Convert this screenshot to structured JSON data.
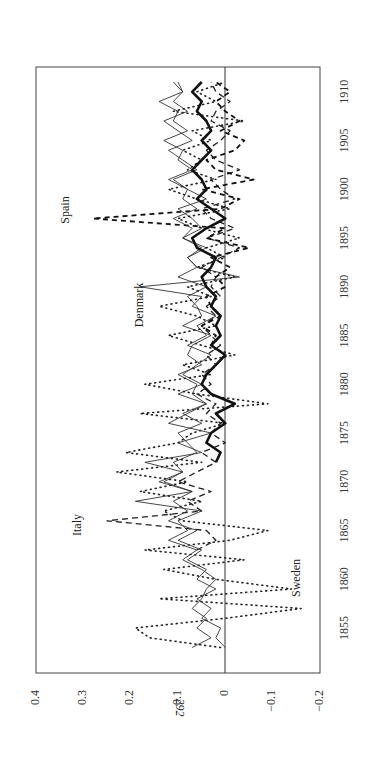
{
  "page": {
    "number": "292"
  },
  "chart_data": {
    "type": "line",
    "orientation": "rotated-90-counterclockwise",
    "title": "",
    "xlabel": "",
    "ylabel": "",
    "x_ticks": [
      1855,
      1860,
      1865,
      1870,
      1875,
      1880,
      1885,
      1890,
      1895,
      1900,
      1905,
      1910
    ],
    "y_ticks": [
      0.4,
      0.3,
      0.2,
      0.1,
      0,
      -0.1,
      -0.2
    ],
    "y_tick_labels": [
      "0.4",
      "0.3",
      "0.2",
      "0.1",
      "0",
      "−0.1",
      "−0.2"
    ],
    "xlim": [
      1852,
      1912
    ],
    "ylim": [
      -0.2,
      0.4
    ],
    "grid": false,
    "zero_line": true,
    "x": [
      1853,
      1854,
      1855,
      1856,
      1857,
      1858,
      1859,
      1860,
      1861,
      1862,
      1863,
      1864,
      1865,
      1866,
      1867,
      1868,
      1869,
      1870,
      1871,
      1872,
      1873,
      1874,
      1875,
      1876,
      1877,
      1878,
      1879,
      1880,
      1881,
      1882,
      1883,
      1884,
      1885,
      1886,
      1887,
      1888,
      1889,
      1890,
      1891,
      1892,
      1893,
      1894,
      1895,
      1896,
      1897,
      1898,
      1899,
      1900,
      1901,
      1902,
      1903,
      1904,
      1905,
      1906,
      1907,
      1908,
      1909,
      1910,
      1911
    ],
    "series": [
      {
        "name": "Italy",
        "style": "dashed",
        "label": "Italy",
        "values": [
          null,
          null,
          null,
          null,
          null,
          null,
          null,
          null,
          null,
          null,
          0.06,
          0.02,
          0.04,
          0.25,
          0.05,
          0.08,
          0.03,
          0.1,
          0.06,
          0.02,
          0.05,
          0.0,
          0.03,
          0.01,
          0.04,
          0.02,
          0.06,
          0.03,
          0.05,
          0.02,
          0.04,
          0.01,
          0.03,
          0.05,
          0.02,
          0.04,
          0.01,
          0.03,
          0.02,
          0.05,
          0.01,
          -0.03,
          0.04,
          -0.02,
          0.03,
          0.05,
          -0.02,
          0.01,
          0.03,
          -0.03,
          0.02,
          0.04,
          0.01,
          -0.01,
          0.03,
          0.02,
          -0.01,
          0.02,
          0.03
        ]
      },
      {
        "name": "Spain",
        "style": "dashed-heavy",
        "label": "Spain",
        "values": [
          null,
          null,
          null,
          null,
          null,
          null,
          null,
          null,
          null,
          null,
          null,
          null,
          null,
          null,
          null,
          null,
          null,
          null,
          null,
          null,
          null,
          null,
          null,
          null,
          null,
          null,
          null,
          null,
          null,
          null,
          null,
          0.03,
          0.02,
          0.05,
          0.01,
          0.03,
          0.04,
          0.0,
          0.02,
          -0.01,
          0.03,
          -0.05,
          0.04,
          0.0,
          0.28,
          0.01,
          -0.03,
          0.05,
          -0.06,
          0.02,
          0.04,
          -0.02,
          -0.04,
          0.01,
          -0.03,
          0.0,
          0.02,
          -0.01,
          0.02
        ]
      },
      {
        "name": "Denmark",
        "style": "solid-thin",
        "label": "Denmark",
        "values": [
          0.07,
          0.03,
          0.06,
          0.04,
          0.07,
          0.05,
          0.04,
          0.02,
          0.05,
          0.09,
          0.06,
          0.12,
          0.08,
          0.1,
          0.05,
          0.19,
          0.07,
          0.14,
          0.09,
          0.17,
          0.05,
          0.1,
          0.03,
          0.12,
          0.08,
          0.04,
          0.1,
          0.05,
          0.09,
          0.06,
          0.03,
          0.08,
          0.04,
          0.06,
          0.02,
          0.07,
          0.05,
          0.18,
          -0.03,
          0.06,
          0.08,
          0.04,
          0.09,
          0.05,
          0.07,
          0.1,
          0.04,
          0.08,
          0.11,
          0.06,
          0.09,
          0.12,
          0.07,
          0.1,
          0.13,
          0.08,
          0.11,
          0.09,
          0.1
        ]
      },
      {
        "name": "Sweden",
        "style": "dotted",
        "label": "Sweden",
        "values": [
          0.01,
          0.16,
          0.19,
          0.0,
          -0.16,
          0.14,
          -0.14,
          0.02,
          0.13,
          -0.04,
          0.17,
          -0.01,
          -0.09,
          0.09,
          0.13,
          0.05,
          0.18,
          0.08,
          0.23,
          0.05,
          0.21,
          0.1,
          0.07,
          0.0,
          0.18,
          -0.09,
          0.06,
          0.17,
          0.03,
          0.09,
          -0.02,
          0.05,
          0.12,
          0.02,
          0.06,
          0.14,
          0.03,
          0.08,
          -0.02,
          0.06,
          0.0,
          0.04,
          -0.03,
          0.05,
          0.1,
          -0.01,
          0.06,
          0.12,
          0.02,
          0.08,
          0.05,
          0.09,
          0.03,
          0.07,
          -0.04,
          0.11,
          0.02,
          0.06,
          0.0
        ]
      },
      {
        "name": "Other country A",
        "style": "solid-thin",
        "label": "",
        "values": [
          0.0,
          0.02,
          0.01,
          0.05,
          0.03,
          0.06,
          0.02,
          0.06,
          0.04,
          0.08,
          0.05,
          0.1,
          0.06,
          0.12,
          0.08,
          0.11,
          0.07,
          0.13,
          0.09,
          0.11,
          0.06,
          0.08,
          0.1,
          0.05,
          0.09,
          0.04,
          0.07,
          0.06,
          0.1,
          0.05,
          0.08,
          0.07,
          0.03,
          0.09,
          0.05,
          0.06,
          0.08,
          0.04,
          0.1,
          0.06,
          0.08,
          0.05,
          0.09,
          0.07,
          0.11,
          0.06,
          0.09,
          0.08,
          0.12,
          0.07,
          0.1,
          0.09,
          0.13,
          0.08,
          0.11,
          0.1,
          0.14,
          0.09,
          0.11
        ]
      },
      {
        "name": "Average",
        "style": "solid-thick",
        "label": "",
        "values": [
          null,
          null,
          null,
          null,
          null,
          null,
          null,
          null,
          null,
          null,
          null,
          null,
          null,
          null,
          null,
          null,
          null,
          null,
          null,
          0.02,
          0.01,
          0.04,
          0.03,
          0.0,
          0.02,
          -0.02,
          0.03,
          0.05,
          0.04,
          0.02,
          0.0,
          0.03,
          0.01,
          0.02,
          0.01,
          0.03,
          0.02,
          0.04,
          0.05,
          0.03,
          0.02,
          0.06,
          0.07,
          0.04,
          0.0,
          0.03,
          0.06,
          0.04,
          0.05,
          0.07,
          0.05,
          0.03,
          0.05,
          0.03,
          0.04,
          0.06,
          0.05,
          0.07,
          0.05
        ]
      }
    ],
    "annotations": [
      "Spain",
      "Denmark",
      "Italy",
      "Sweden"
    ]
  }
}
